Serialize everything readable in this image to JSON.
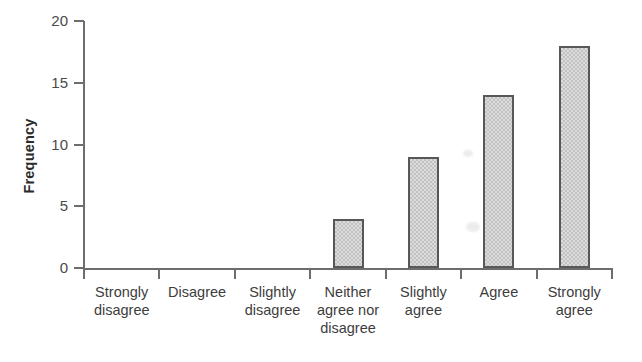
{
  "chart_data": {
    "type": "bar",
    "title": "",
    "xlabel": "",
    "ylabel": "Frequency",
    "categories": [
      "Strongly\ndisagree",
      "Disagree",
      "Slightly\ndisagree",
      "Neither\nagree nor\ndisagree",
      "Slightly\nagree",
      "Agree",
      "Strongly\nagree"
    ],
    "values": [
      0,
      0,
      0,
      4,
      9,
      14,
      18
    ],
    "ylim": [
      0,
      20
    ],
    "yticks": [
      0,
      5,
      10,
      15,
      20
    ],
    "ytick_labels": [
      "0",
      "5",
      "10",
      "15",
      "20"
    ],
    "grid": false,
    "legend": false,
    "bar_fill_color": "#cfcfcf",
    "bar_edge_color": "#585858",
    "axis_color": "#6d6d6d",
    "text_color": "#3d3d3d"
  },
  "axis": {
    "y_title": "Frequency"
  }
}
